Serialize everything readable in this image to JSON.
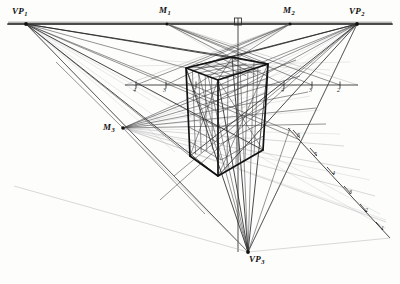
{
  "figure": {
    "type": "technical-perspective-construction-drawing",
    "title_visible": false,
    "background_color": "#fdfdfc",
    "ink_color": "#1a1a1a",
    "faint_ink_color": "#9a9a9a"
  },
  "horizon": {
    "y": 24,
    "x_start": 8,
    "x_end": 392,
    "label": "horizon-line"
  },
  "vanishing_points": [
    {
      "id": "VP1",
      "label": "VP",
      "sub": "1",
      "x": 26,
      "y": 24,
      "label_x": 12,
      "label_y": 9
    },
    {
      "id": "VP2",
      "label": "VP",
      "sub": "2",
      "x": 357,
      "y": 24,
      "label_x": 352,
      "label_y": 9
    },
    {
      "id": "VP3",
      "label": "VP",
      "sub": "3",
      "x": 248,
      "y": 252,
      "label_x": 249,
      "label_y": 255
    }
  ],
  "measuring_points": [
    {
      "id": "M1",
      "label": "M",
      "sub": "1",
      "x": 167,
      "y": 24,
      "label_x": 160,
      "label_y": 8
    },
    {
      "id": "M2",
      "label": "M",
      "sub": "2",
      "x": 290,
      "y": 24,
      "label_x": 285,
      "label_y": 8
    },
    {
      "id": "M3",
      "label": "M",
      "sub": "3",
      "x": 123,
      "y": 128,
      "label_x": 105,
      "label_y": 125
    }
  ],
  "cube": {
    "name": "gridded-rectangular-prism",
    "top_front": {
      "x": 218,
      "y": 80
    },
    "top_left": {
      "x": 186,
      "y": 68
    },
    "top_right": {
      "x": 268,
      "y": 64
    },
    "top_back": {
      "x": 232,
      "y": 57
    },
    "bottom_front": {
      "x": 218,
      "y": 176
    },
    "bottom_left": {
      "x": 190,
      "y": 156
    },
    "bottom_right": {
      "x": 263,
      "y": 150
    },
    "grid_divisions_u": 5,
    "grid_divisions_v": 5,
    "grid_divisions_w": 6
  },
  "measuring_line_horizontal": {
    "y": 85,
    "x_start": 125,
    "x_end": 358,
    "ticks": [
      {
        "x": 136,
        "num": "4"
      },
      {
        "x": 166,
        "num": "3"
      },
      {
        "x": 196,
        "num": "2"
      },
      {
        "x": 284,
        "num": "4"
      },
      {
        "x": 312,
        "num": "3"
      },
      {
        "x": 340,
        "num": "2"
      }
    ]
  },
  "measuring_line_diagonal": {
    "x_start": 290,
    "y_start": 131,
    "x_end": 386,
    "y_end": 234,
    "ticks": [
      {
        "num": "6",
        "x": 296,
        "y": 138
      },
      {
        "num": "5",
        "x": 313,
        "y": 157
      },
      {
        "num": "4",
        "x": 331,
        "y": 177
      },
      {
        "num": "3",
        "x": 348,
        "y": 196
      },
      {
        "num": "2",
        "x": 363,
        "y": 213
      },
      {
        "num": "1",
        "x": 379,
        "y": 231
      }
    ]
  },
  "right_angle_marker": {
    "x": 238,
    "y": 25,
    "size": 7,
    "name": "right-angle-symbol"
  },
  "vertical_axis": {
    "x": 238,
    "y_start": 20,
    "y_end": 252
  }
}
